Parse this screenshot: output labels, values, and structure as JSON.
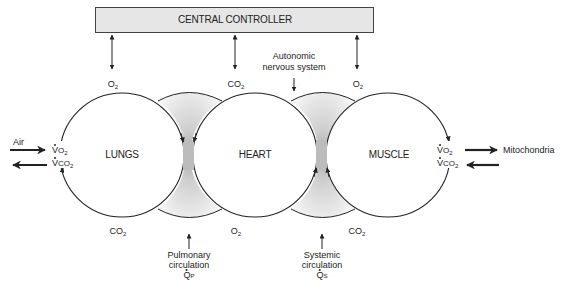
{
  "controller": {
    "label": "CENTRAL CONTROLLER"
  },
  "organs": [
    {
      "id": "lungs",
      "label": "LUNGS"
    },
    {
      "id": "heart",
      "label": "HEART"
    },
    {
      "id": "muscle",
      "label": "MUSCLE"
    }
  ],
  "top_gases": [
    {
      "main": "O",
      "sub": "2"
    },
    {
      "main": "CO",
      "sub": "2"
    },
    {
      "main": "O",
      "sub": "2"
    }
  ],
  "bottom_gases": [
    {
      "main": "CO",
      "sub": "2"
    },
    {
      "main": "O",
      "sub": "2"
    },
    {
      "main": "CO",
      "sub": "2"
    }
  ],
  "autonomic": {
    "line1": "Autonomic",
    "line2": "nervous system"
  },
  "left_exchange": {
    "air_label": "Air",
    "vo2": {
      "main": "V",
      "o": "O",
      "sub": "2"
    },
    "vco2": {
      "main": "V",
      "o": "CO",
      "sub": "2"
    }
  },
  "right_exchange": {
    "mito_label": "Mitochondria",
    "vo2": {
      "main": "V",
      "o": "O",
      "sub": "2"
    },
    "vco2": {
      "main": "V",
      "o": "CO",
      "sub": "2"
    }
  },
  "pulmonary": {
    "line1": "Pulmonary",
    "line2": "circulation",
    "q": "Q",
    "qsub": "P"
  },
  "systemic": {
    "line1": "Systemic",
    "line2": "circulation",
    "q": "Q",
    "qsub": "S"
  },
  "colors": {
    "stroke": "#222222",
    "box_fill": "#e6e6e6",
    "lens_dark": "#a8a8a8",
    "lens_light": "#f2f2f2"
  }
}
